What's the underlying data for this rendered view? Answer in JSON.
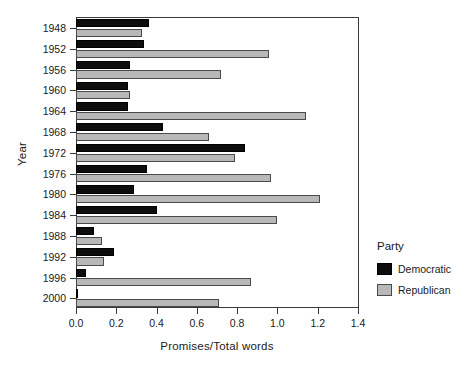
{
  "chart_data": {
    "type": "bar",
    "orientation": "horizontal",
    "title": "",
    "xlabel": "Promises/Total words",
    "ylabel": "Year",
    "xlim": [
      0.0,
      1.4
    ],
    "xticks": [
      "0.0",
      "0.2",
      "0.4",
      "0.6",
      "0.8",
      "1.0",
      "1.2",
      "1.4"
    ],
    "xtick_values": [
      0.0,
      0.2,
      0.4,
      0.6,
      0.8,
      1.0,
      1.2,
      1.4
    ],
    "grid": false,
    "legend": {
      "title": "Party",
      "position": "right",
      "entries": [
        {
          "name": "Democratic",
          "color": "#0d0d0d"
        },
        {
          "name": "Republican",
          "color": "#b8b8b8"
        }
      ]
    },
    "categories": [
      "1948",
      "1952",
      "1956",
      "1960",
      "1964",
      "1968",
      "1972",
      "1976",
      "1980",
      "1984",
      "1988",
      "1992",
      "1996",
      "2000"
    ],
    "series": [
      {
        "name": "Democratic",
        "color": "#0d0d0d",
        "values": [
          0.36,
          0.34,
          0.27,
          0.26,
          0.26,
          0.43,
          0.84,
          0.35,
          0.29,
          0.4,
          0.09,
          0.19,
          0.05,
          0.01
        ]
      },
      {
        "name": "Republican",
        "color": "#b8b8b8",
        "values": [
          0.33,
          0.96,
          0.72,
          0.27,
          1.14,
          0.66,
          0.79,
          0.97,
          1.21,
          1.0,
          0.13,
          0.14,
          0.87,
          0.71
        ]
      }
    ]
  }
}
